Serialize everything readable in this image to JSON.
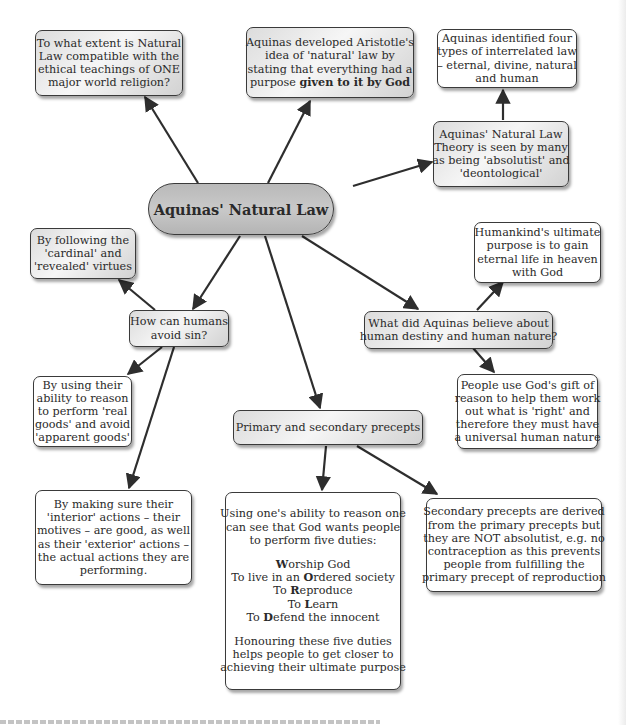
{
  "central": {
    "label": "Aquinas' Natural Law"
  },
  "nodes": {
    "question_religion": {
      "lines": [
        "To what extent is Natural",
        "Law compatible with the",
        "ethical teachings of ONE",
        "major world religion?"
      ]
    },
    "aristotle": {
      "lines": [
        "Aquinas developed Aristotle's",
        "idea of 'natural' law by",
        "stating that everything had a"
      ],
      "last_plain": "purpose ",
      "last_bold": "given to it by God"
    },
    "four_laws": {
      "lines": [
        "Aquinas identified four",
        "types of interrelated law",
        "– eternal, divine, natural",
        "and human"
      ]
    },
    "absolutist": {
      "lines": [
        "Aquinas' Natural Law",
        "Theory is seen by many",
        "as being 'absolutist' and",
        "'deontological'"
      ]
    },
    "virtues": {
      "lines": [
        "By following the",
        "'cardinal' and",
        "'revealed' virtues"
      ]
    },
    "avoid_sin": {
      "lines": [
        "How can humans",
        "avoid sin?"
      ]
    },
    "ultimate_purpose": {
      "lines": [
        "Humankind's ultimate",
        "purpose is to gain",
        "eternal life in heaven",
        "with God"
      ]
    },
    "destiny": {
      "lines": [
        "What did Aquinas believe about",
        "human destiny and human nature?"
      ]
    },
    "reason_gift": {
      "lines": [
        "People use God's gift of",
        "reason to help them work",
        "out what is 'right' and",
        "therefore they must have",
        "a universal human nature"
      ]
    },
    "real_goods": {
      "lines": [
        "By using their",
        "ability to reason",
        "to perform 'real",
        "goods' and avoid",
        "'apparent goods'"
      ]
    },
    "precepts": {
      "lines": [
        "Primary and secondary precepts"
      ]
    },
    "interior": {
      "lines": [
        "By making sure their",
        "'interior' actions – their",
        "motives – are good, as well",
        "as their 'exterior' actions –",
        "the actual actions they are",
        "performing."
      ]
    },
    "five_duties": {
      "intro": [
        "Using one's ability to reason one",
        "can see that God wants people",
        "to perform five duties:"
      ],
      "duties": [
        {
          "pre": "",
          "bold": "W",
          "post": "orship God"
        },
        {
          "pre": "To live in an ",
          "bold": "O",
          "post": "rdered society"
        },
        {
          "pre": "To ",
          "bold": "R",
          "post": "eproduce"
        },
        {
          "pre": "To ",
          "bold": "L",
          "post": "earn"
        },
        {
          "pre": "To ",
          "bold": "D",
          "post": "efend the innocent"
        }
      ],
      "outro": [
        "Honouring these five duties",
        "helps people to get closer to",
        "achieving their ultimate purpose"
      ]
    },
    "secondary": {
      "lines": [
        "Secondary precepts are derived",
        "from the primary precepts but",
        "they are NOT absolutist, e.g. no",
        "contraception as this prevents",
        "people from fulfilling the",
        "primary precept of reproduction"
      ]
    }
  },
  "colors": {
    "line": "#2e2e2e",
    "grey_box": "#e2e2e2",
    "center_fill": "#bdbdbd"
  }
}
